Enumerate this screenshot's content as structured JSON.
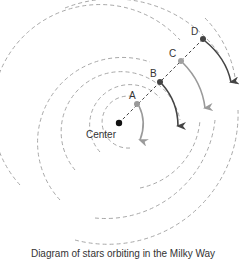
{
  "diagram": {
    "title": "Diagram of stars orbiting in the Milky Way",
    "center": {
      "label": "Center",
      "color": "#111111"
    },
    "stars": [
      {
        "id": "A",
        "label": "A",
        "color": "#9a9a9a",
        "arrow_color": "#9a9a9a"
      },
      {
        "id": "B",
        "label": "B",
        "color": "#444444",
        "arrow_color": "#444444"
      },
      {
        "id": "C",
        "label": "C",
        "color": "#a0a0a0",
        "arrow_color": "#a0a0a0"
      },
      {
        "id": "D",
        "label": "D",
        "color": "#444444",
        "arrow_color": "#444444"
      }
    ],
    "orbit_color": "#a8a8a8"
  }
}
